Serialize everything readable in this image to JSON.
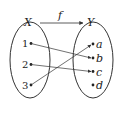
{
  "diagram": {
    "type": "function-mapping",
    "domain_set": {
      "label": "X",
      "elements": [
        "1",
        "2",
        "3"
      ]
    },
    "codomain_set": {
      "label": "Y",
      "elements": [
        "a",
        "b",
        "c",
        "d"
      ]
    },
    "function_label": "f",
    "mappings": [
      {
        "from": "1",
        "to": "b"
      },
      {
        "from": "2",
        "to": "c"
      },
      {
        "from": "3",
        "to": "a"
      }
    ],
    "colors": {
      "stroke": "#333333",
      "background": "#ffffff"
    }
  }
}
